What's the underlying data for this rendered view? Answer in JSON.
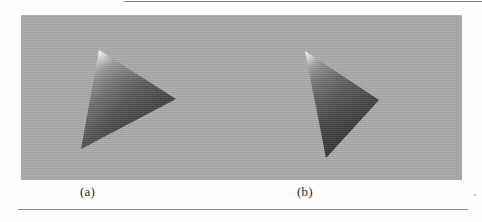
{
  "figure": {
    "kind": "shaded-triangle-rendering-figure",
    "background_color": "#fefefe",
    "panel": {
      "background_color": "#a9a9a9",
      "x": 21,
      "y": 15,
      "width": 441,
      "height": 165
    },
    "rules": {
      "top": {
        "x": 124,
        "y": 1,
        "width": 358,
        "color": "#7e7e7e"
      },
      "bottom": {
        "x": 18,
        "y": 209,
        "width": 450,
        "color": "#8a8a8a"
      }
    },
    "captions": [
      {
        "name": "caption-a",
        "label": "(a)",
        "x": 80,
        "y": 184
      },
      {
        "name": "caption-b",
        "label": "(b)",
        "x": 297,
        "y": 184
      }
    ],
    "shapes": [
      {
        "name": "triangle-a",
        "caption": "(a)",
        "description": "Gouraud/smooth shaded triangle pointing right, bright specular highlight at top apex, darkening toward lower-right",
        "vertices": [
          {
            "label": "apex",
            "x": 99,
            "y": 50,
            "shade": "#e6e6e6"
          },
          {
            "label": "bottom-left",
            "x": 81,
            "y": 149,
            "shade": "#6f6f6f"
          },
          {
            "label": "right",
            "x": 176,
            "y": 99,
            "shade": "#3a3a3a"
          }
        ],
        "highlight_color": "#ececec",
        "dark_color": "#3a3a3a",
        "mid_color": "#6b6b6b"
      },
      {
        "name": "triangle-b",
        "caption": "(b)",
        "description": "Same shaded triangle rotated, apex with highlight at upper-left, vertices at mid-right and bottom",
        "vertices": [
          {
            "label": "apex",
            "x": 305,
            "y": 51,
            "shade": "#e6e6e6"
          },
          {
            "label": "right",
            "x": 379,
            "y": 100,
            "shade": "#4a4a4a"
          },
          {
            "label": "bottom",
            "x": 326,
            "y": 158,
            "shade": "#3a3a3a"
          }
        ],
        "highlight_color": "#ececec",
        "dark_color": "#3a3a3a",
        "mid_color": "#6b6b6b"
      }
    ]
  }
}
